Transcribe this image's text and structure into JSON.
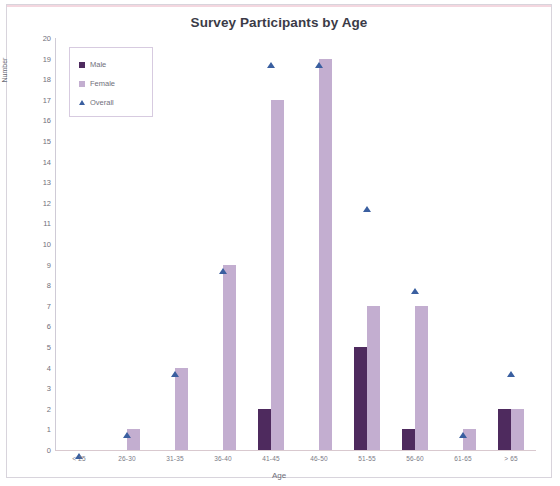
{
  "chart_data": {
    "type": "bar",
    "title": "Survey Participants by Age",
    "xlabel": "Age",
    "ylabel": "Number",
    "ylim": [
      0,
      20
    ],
    "ytick_step": 1,
    "grid": false,
    "legend_position": "top-left",
    "categories": [
      "< 25",
      "26-30",
      "31-35",
      "36-40",
      "41-45",
      "46-50",
      "51-55",
      "56-60",
      "61-65",
      "> 65"
    ],
    "series": [
      {
        "name": "Male",
        "type": "bar",
        "color": "#4e2a5e",
        "values": [
          0,
          0,
          0,
          0,
          2,
          0,
          5,
          1,
          0,
          2
        ]
      },
      {
        "name": "Female",
        "type": "bar",
        "color": "#c3aed0",
        "values": [
          0,
          1,
          4,
          9,
          17,
          19,
          7,
          7,
          1,
          2
        ]
      },
      {
        "name": "Overall",
        "type": "scatter",
        "color": "#3a5fa0",
        "values": [
          0,
          1,
          4,
          9,
          19,
          19,
          12,
          8,
          1,
          4
        ]
      }
    ],
    "yticks": [
      "20",
      "19",
      "18",
      "17",
      "16",
      "15",
      "14",
      "13",
      "12",
      "11",
      "10",
      "9",
      "8",
      "7",
      "6",
      "5",
      "4",
      "3",
      "2",
      "1",
      "0"
    ]
  },
  "legend": {
    "items": [
      {
        "label": "Male",
        "marker": "square-swatch-icon"
      },
      {
        "label": "Female",
        "marker": "square-swatch-icon"
      },
      {
        "label": "Overall",
        "marker": "triangle-marker-icon"
      }
    ]
  }
}
